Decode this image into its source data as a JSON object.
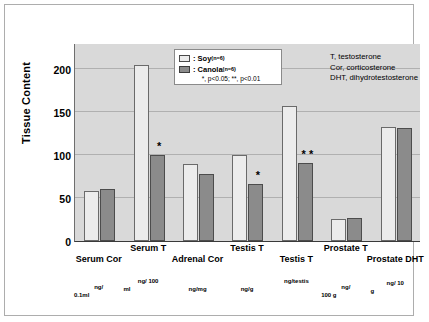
{
  "chart_data": {
    "type": "bar",
    "title": "",
    "xlabel": "",
    "ylabel": "Tissue Content",
    "ylim": [
      0,
      230
    ],
    "yticks": [
      0,
      50,
      100,
      150,
      200
    ],
    "grid": true,
    "legend_position": "top-center",
    "categories": [
      "Serum Cor",
      "Serum T",
      "Adrenal Cor",
      "Testis T",
      "Testis T",
      "Prostate T",
      "Prostate DHT"
    ],
    "category_units": [
      [
        "ng/",
        "0.1ml"
      ],
      [
        "ng/ 100",
        "ml"
      ],
      [
        "ng/mg",
        ""
      ],
      [
        "ng/g",
        ""
      ],
      [
        "ng/testis",
        ""
      ],
      [
        "ng/",
        "100 g"
      ],
      [
        "ng/ 10",
        "g"
      ]
    ],
    "series": [
      {
        "name": "Soy",
        "n_label": "(n=6)",
        "color": "#ececec",
        "values": [
          58,
          205,
          89,
          100,
          157,
          26,
          133
        ]
      },
      {
        "name": "Canola",
        "n_label": "(n=6)",
        "color": "#8b8b8b",
        "values": [
          61,
          100,
          78,
          66,
          91,
          27,
          131
        ]
      }
    ],
    "significance": [
      {
        "category_index": 1,
        "series": "Canola",
        "marker": "*"
      },
      {
        "category_index": 3,
        "series": "Canola",
        "marker": "*"
      },
      {
        "category_index": 4,
        "series": "Canola",
        "marker": "* *"
      }
    ]
  },
  "legend": {
    "soy_label": ": Soy",
    "soy_n": "(n=6)",
    "canola_label": ": Canola",
    "canola_n": "(n=6)",
    "pvalue_note": "*, p<0.05; **, p<0.01"
  },
  "abbreviations": {
    "line1": "T, testosterone",
    "line2": "Cor, corticosterone",
    "line3": "DHT, dihydrotestosterone"
  },
  "axis": {
    "y_title": "Tissue Content",
    "y_tick_0": "0",
    "y_tick_50": "50",
    "y_tick_100": "100",
    "y_tick_150": "150",
    "y_tick_200": "200"
  }
}
